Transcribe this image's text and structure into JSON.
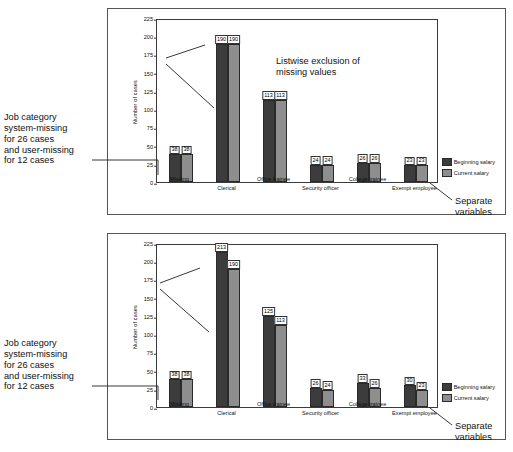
{
  "figure": {
    "captions": {
      "left_top": "Job category\nsystem-missing\nfor 26 cases\nand user-missing\nfor 12 cases",
      "left_bottom": "Job category\nsystem-missing\nfor 26 cases\nand user-missing\nfor 12 cases",
      "right_top": "Separate\nvariables",
      "right_bottom": "Separate\nvariables"
    }
  },
  "chart_data": [
    {
      "type": "bar",
      "title": "",
      "annotation": "Listwise exclusion of\nmissing values",
      "xlabel": "",
      "ylabel": "Number of cases",
      "ylim": [
        0,
        225
      ],
      "yticks": [
        0,
        25,
        50,
        75,
        100,
        125,
        150,
        175,
        200,
        225
      ],
      "grid": false,
      "legend_position": "right",
      "categories": [
        "Missing",
        "Clerical",
        "Office trainee",
        "Security officer",
        "College trainee",
        "Exempt employee"
      ],
      "series": [
        {
          "name": "Beginning salary",
          "color": "#3c3c3c",
          "values": [
            38,
            190,
            113,
            24,
            26,
            23
          ]
        },
        {
          "name": "Current salary",
          "color": "#8e8e8e",
          "values": [
            38,
            190,
            113,
            24,
            26,
            23
          ]
        }
      ]
    },
    {
      "type": "bar",
      "title": "",
      "annotation": "Variable-by-variable\nexclusion of missing\nvalues",
      "xlabel": "",
      "ylabel": "Number of cases",
      "ylim": [
        0,
        225
      ],
      "yticks": [
        0,
        25,
        50,
        75,
        100,
        125,
        150,
        175,
        200,
        225
      ],
      "grid": false,
      "legend_position": "right",
      "categories": [
        "Missing",
        "Clerical",
        "Office trainee",
        "Security officer",
        "College trainee",
        "Exempt employee"
      ],
      "series": [
        {
          "name": "Beginning salary",
          "color": "#3c3c3c",
          "values": [
            38,
            213,
            125,
            26,
            33,
            30
          ]
        },
        {
          "name": "Current salary",
          "color": "#8e8e8e",
          "values": [
            38,
            190,
            113,
            24,
            26,
            23
          ]
        }
      ]
    }
  ]
}
